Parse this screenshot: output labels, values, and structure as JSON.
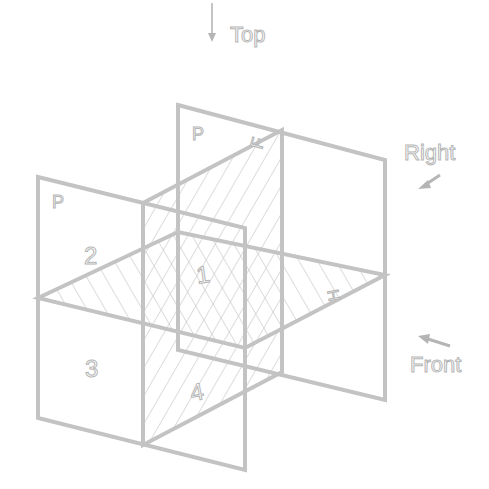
{
  "diagram": {
    "type": "projection-planes-isometric",
    "colors": {
      "line": "#c3c3c3",
      "hatch": "#c9c9c9",
      "text_stroke": "#b5b5b5",
      "background": "#ffffff"
    },
    "directions": {
      "top": {
        "label": "Top",
        "arrow": "down-arrow"
      },
      "right": {
        "label": "Right",
        "arrow": "down-left-arrow"
      },
      "front": {
        "label": "Front",
        "arrow": "up-left-arrow"
      }
    },
    "plane_labels": {
      "back_plane": "P",
      "left_plane": "P",
      "vertical_plane": "F",
      "horizontal_plane": "H"
    },
    "quadrants": [
      "1",
      "2",
      "3",
      "4"
    ]
  }
}
